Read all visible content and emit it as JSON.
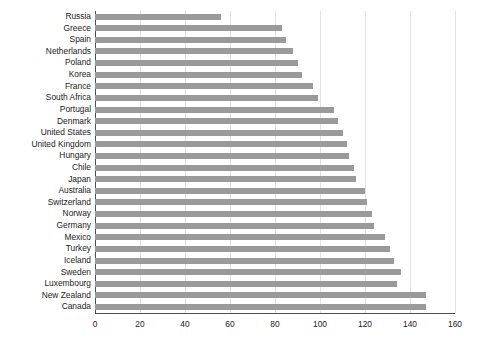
{
  "chart_data": {
    "type": "bar",
    "orientation": "horizontal",
    "title": "",
    "subtitle": "",
    "xlabel": "",
    "ylabel": "",
    "xlim": [
      0,
      160
    ],
    "ylim": null,
    "grid": true,
    "legend": null,
    "legend_position": "none",
    "xticks": [
      0,
      20,
      40,
      60,
      80,
      100,
      120,
      140,
      160
    ],
    "xtick_labels": [
      "0",
      "20",
      "40",
      "60",
      "80",
      "100",
      "120",
      "140",
      "160"
    ],
    "bar_color": "#9a9a9a",
    "axis_color": "#4d4d4d",
    "grid_color": "#e2e2e2",
    "text_color": "#1a1a1a",
    "categories": [
      "Russia",
      "Greece",
      "Spain",
      "Netherlands",
      "Poland",
      "Korea",
      "France",
      "South Africa",
      "Portugal",
      "Denmark",
      "United States",
      "United Kingdom",
      "Hungary",
      "Chile",
      "Japan",
      "Australia",
      "Switzerland",
      "Norway",
      "Germany",
      "Mexico",
      "Turkey",
      "Iceland",
      "Sweden",
      "Luxembourg",
      "New Zealand",
      "Canada"
    ],
    "values": [
      56,
      83,
      85,
      88,
      90,
      92,
      97,
      99,
      106,
      108,
      110,
      112,
      113,
      115,
      116,
      120,
      121,
      123,
      124,
      129,
      131,
      133,
      136,
      134,
      147,
      147
    ]
  }
}
